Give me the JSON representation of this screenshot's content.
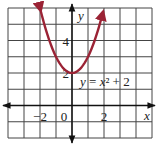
{
  "chart_data": {
    "type": "line",
    "title": "",
    "equation_label": "y = x² + 2",
    "xlabel": "x",
    "ylabel": "y",
    "xlim": [
      -4,
      5
    ],
    "ylim": [
      -2,
      6
    ],
    "grid": true,
    "x_tick_labels": [
      {
        "value": -2,
        "label": "−2"
      },
      {
        "value": 0,
        "label": "0"
      },
      {
        "value": 2,
        "label": "2"
      }
    ],
    "y_tick_labels": [
      {
        "value": 2,
        "label": "2"
      },
      {
        "value": 4,
        "label": "4"
      }
    ],
    "series": [
      {
        "name": "y = x² + 2",
        "function": "x^2 + 2",
        "vertex": [
          0,
          2
        ],
        "x": [
          -2,
          -1.5,
          -1,
          -0.5,
          0,
          0.5,
          1,
          1.5,
          2
        ],
        "y": [
          6,
          4.25,
          3,
          2.25,
          2,
          2.25,
          3,
          4.25,
          6
        ],
        "color": "#9b2335",
        "arrows_at_ends": true
      }
    ]
  },
  "colors": {
    "grid": "#444444",
    "axis": "#111111",
    "curve": "#9b2335"
  }
}
